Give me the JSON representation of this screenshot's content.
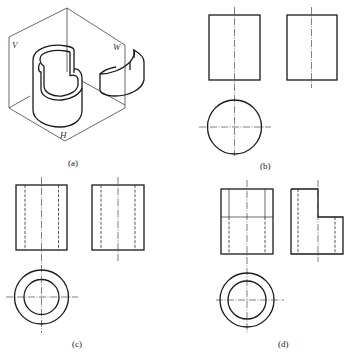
{
  "figure": {
    "panels": [
      {
        "id": "a",
        "label": "(a)",
        "description": "Isometric view of a cylindrical shell with notched top, placed in a three-plane projection corner",
        "plane_labels": {
          "vertical": "V",
          "side": "W",
          "horizontal": "H"
        }
      },
      {
        "id": "b",
        "label": "(b)",
        "description": "Three views of a solid cylinder: front, side, top"
      },
      {
        "id": "c",
        "label": "(c)",
        "description": "Three views of a hollow cylinder (tube) with hidden bore lines"
      },
      {
        "id": "d",
        "label": "(d)",
        "description": "Three views of a hollow cylinder with a step cut in the upper half"
      }
    ]
  },
  "colors": {
    "line": "#1a1a1a",
    "background": "#ffffff"
  }
}
